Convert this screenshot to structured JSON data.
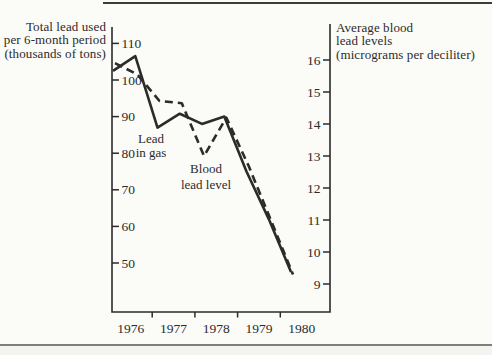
{
  "figure": {
    "left_axis_title": [
      "Total lead used",
      "per 6-month period",
      "(thousands of tons)"
    ],
    "right_axis_title": [
      "Average blood",
      "lead levels",
      "(micrograms per deciliter)"
    ],
    "annotations": {
      "lead_in_gas": [
        "Lead",
        "in gas"
      ],
      "blood_lead_level": [
        "Blood",
        "lead level"
      ]
    }
  },
  "colors": {
    "ink": "#2b2b2b",
    "paper": "#fbfbf8",
    "rule_top": "#3c3c3c",
    "rule_bottom": "#7e7e7e"
  },
  "chart_data": {
    "type": "line",
    "title": "",
    "x_unit": "6-month period",
    "categories": [
      "1976 H1",
      "1976 H2",
      "1977 H1",
      "1977 H2",
      "1978 H1",
      "1978 H2",
      "1979 H1",
      "1979 H2",
      "1980 H1"
    ],
    "series": [
      {
        "name": "Lead in gas",
        "axis": "left",
        "line_style": "solid",
        "values": [
          102.5,
          106.5,
          87,
          90.8,
          88,
          90,
          75,
          62,
          47.5
        ]
      },
      {
        "name": "Blood lead level",
        "axis": "right",
        "line_style": "dashed",
        "values": [
          15.9,
          15.55,
          14.72,
          14.65,
          13,
          14.2,
          12.7,
          11,
          9.3
        ]
      }
    ],
    "left_axis": {
      "label": "Total lead used per 6-month period (thousands of tons)",
      "ticks": [
        110,
        100,
        90,
        80,
        70,
        60,
        50
      ],
      "range_shown": [
        46,
        112
      ]
    },
    "right_axis": {
      "label": "Average blood lead levels (micrograms per deciliter)",
      "ticks": [
        16,
        15,
        14,
        13,
        12,
        11,
        10,
        9
      ],
      "range_shown": [
        8.6,
        17.1
      ]
    },
    "x_axis": {
      "year_labels": [
        "1976",
        "1977",
        "1978",
        "1979",
        "1980"
      ],
      "boundary_tick_years": [
        1977,
        1978,
        1979,
        1980
      ],
      "range_shown": [
        1976,
        1981.1
      ]
    },
    "grid": false,
    "legend": "inline text annotations"
  }
}
